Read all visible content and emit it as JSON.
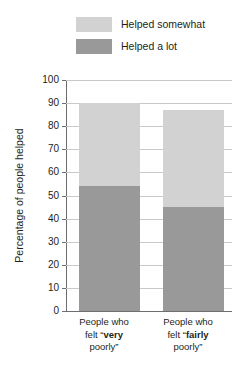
{
  "chart_data": {
    "type": "bar",
    "stacked": true,
    "title": "",
    "xlabel": "",
    "ylabel": "Percentage of people helped",
    "ylim": [
      0,
      100
    ],
    "ytick_step": 10,
    "yticks": [
      100,
      90,
      80,
      70,
      60,
      50,
      40,
      30,
      20,
      10,
      0
    ],
    "grid": true,
    "legend_position": "top",
    "categories": [
      "People who felt \"very poorly\"",
      "People who felt \"fairly poorly\""
    ],
    "series": [
      {
        "name": "Helped a lot",
        "values": [
          54,
          45
        ],
        "color": "#999999"
      },
      {
        "name": "Helped somewhat",
        "values": [
          36,
          42
        ],
        "color": "#d2d2d2"
      }
    ],
    "totals": [
      90,
      87
    ]
  },
  "legend": {
    "items": [
      {
        "label": "Helped somewhat",
        "color": "#d2d2d2"
      },
      {
        "label": "Helped a lot",
        "color": "#999999"
      }
    ]
  },
  "axis": {
    "y_title": "Percentage of people helped",
    "y_ticks": [
      "100",
      "90",
      "80",
      "70",
      "60",
      "50",
      "40",
      "30",
      "20",
      "10",
      "0"
    ]
  },
  "categories": [
    {
      "line1": "People who",
      "line2_pre": "felt “",
      "line2_bold": "very",
      "line3": "poorly”"
    },
    {
      "line1": "People who",
      "line2_pre": "felt “",
      "line2_bold": "fairly",
      "line3": "poorly”"
    }
  ],
  "colors": {
    "helped_somewhat": "#d2d2d2",
    "helped_a_lot": "#999999",
    "axis": "#6d6e71",
    "grid": "#c9c9c9",
    "text": "#231f20",
    "background": "#ffffff"
  }
}
